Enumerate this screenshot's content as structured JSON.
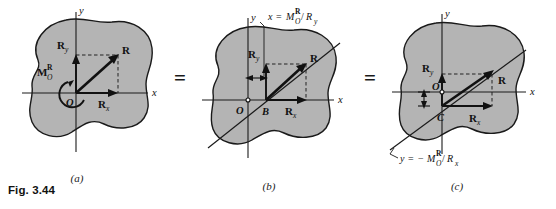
{
  "figure": {
    "caption": "Fig. 3.44",
    "equals_1": "=",
    "equals_2": "="
  },
  "panels": [
    {
      "id": "a",
      "label": "(a)",
      "axis_x": "x",
      "axis_y": "y",
      "origin": "O",
      "labels": {
        "resultant": "R",
        "ry_main": "R",
        "ry_sub": "y",
        "rx_main": "R",
        "rx_sub": "x",
        "moment_main": "M",
        "moment_sub": "O",
        "moment_sup": "R"
      }
    },
    {
      "id": "b",
      "label": "(b)",
      "axis_x": "x",
      "axis_y": "y",
      "origin": "O",
      "point": "B",
      "equation": {
        "var": "x",
        "equals": "=",
        "num_main": "M",
        "num_sub": "O",
        "num_sup": "R",
        "slash": "/",
        "den_main": "R",
        "den_sub": "y"
      },
      "labels": {
        "resultant": "R",
        "ry_main": "R",
        "ry_sub": "y",
        "rx_main": "R",
        "rx_sub": "x"
      }
    },
    {
      "id": "c",
      "label": "(c)",
      "axis_x": "x",
      "axis_y": "y",
      "origin": "O",
      "point": "C",
      "equation": {
        "var": "y",
        "equals": "=",
        "minus": "−",
        "num_main": "M",
        "num_sub": "O",
        "num_sup": "R",
        "slash": "/",
        "den_main": "R",
        "den_sub": "x"
      },
      "labels": {
        "resultant": "R",
        "ry_main": "R",
        "ry_sub": "y",
        "rx_main": "R",
        "rx_sub": "x"
      }
    }
  ],
  "colors": {
    "blob_fill": "#b4b4b4",
    "ink": "#111111",
    "background": "#ffffff"
  }
}
